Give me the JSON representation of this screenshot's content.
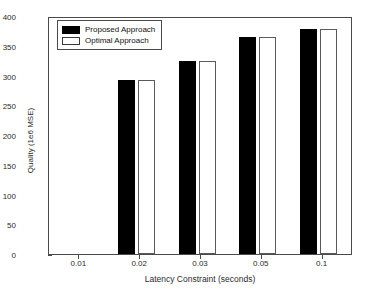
{
  "chart_data": {
    "type": "bar",
    "title": "",
    "xlabel": "Latency Constraint (seconds)",
    "ylabel": "Quality (1e6 MSE)",
    "categories": [
      "0.01",
      "0.02",
      "0.03",
      "0.05",
      "0.1"
    ],
    "series": [
      {
        "name": "Proposed Approach",
        "color": "#000000",
        "values": [
          0,
          292,
          325,
          364,
          379
        ]
      },
      {
        "name": "Optimal Approach",
        "color": "#ffffff",
        "values": [
          0,
          292,
          325,
          364,
          379
        ]
      }
    ],
    "ylim": [
      0,
      400
    ],
    "yticks": [
      0,
      50,
      100,
      150,
      200,
      250,
      300,
      350,
      400
    ],
    "ytick_labels": [
      "0",
      "50",
      "100",
      "150",
      "200",
      "250",
      "300",
      "350",
      "400"
    ],
    "grid": false,
    "legend_position": "top-left",
    "legend": [
      "Proposed Approach",
      "Optimal Approach"
    ]
  },
  "legend": {
    "entries": [
      {
        "label": "Proposed Approach",
        "style": "filled-black"
      },
      {
        "label": "Optimal Approach",
        "style": "outlined-white"
      }
    ]
  },
  "axes": {
    "x_label": "Latency Constraint (seconds)",
    "y_label": "Quality (1e6 MSE)"
  }
}
